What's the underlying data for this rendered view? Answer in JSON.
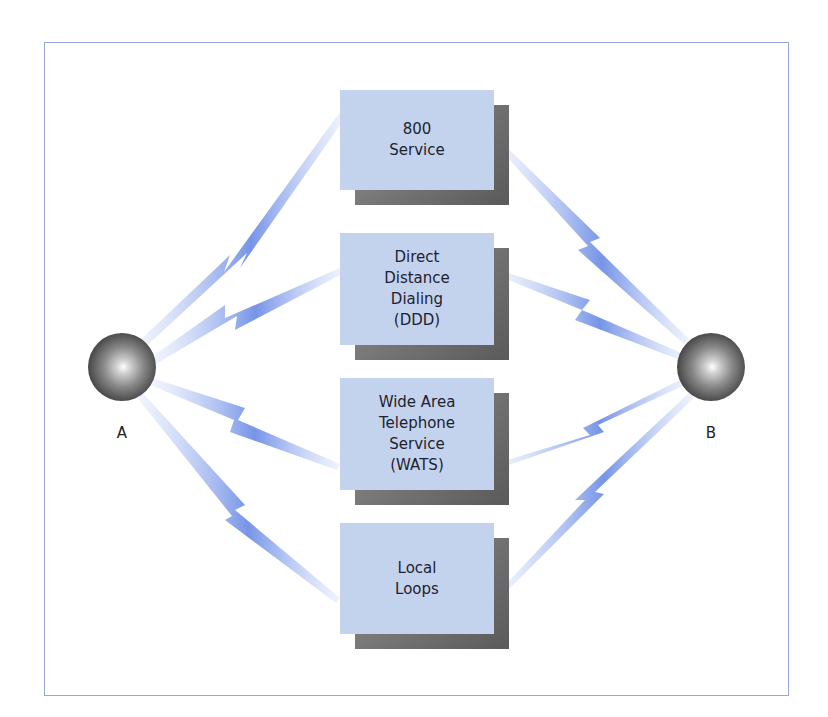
{
  "diagram": {
    "nodes": [
      {
        "id": "A",
        "label": "A"
      },
      {
        "id": "B",
        "label": "B"
      }
    ],
    "services": [
      {
        "label": "800\nService"
      },
      {
        "label": "Direct\nDistance\nDialing\n(DDD)"
      },
      {
        "label": "Wide Area\nTelephone\nService\n(WATS)"
      },
      {
        "label": "Local\nLoops"
      }
    ],
    "colors": {
      "box_fill": "#c4d3ed",
      "shadow": "#6e6e6e",
      "frame_border": "#9aa6d8",
      "link_blue": "#6f8fe6"
    }
  }
}
